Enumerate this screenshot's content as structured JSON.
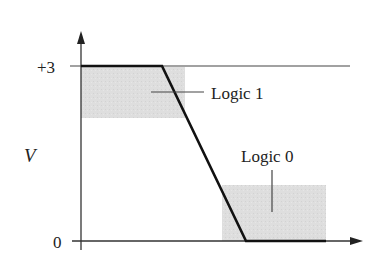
{
  "diagram": {
    "type": "logic-level voltage transition",
    "y_axis": {
      "label": "V",
      "ticks": [
        {
          "label": "+3",
          "value": 3
        },
        {
          "label": "0",
          "value": 0
        }
      ]
    },
    "regions": [
      {
        "label": "Logic 1",
        "description": "shaded band just below +3 V"
      },
      {
        "label": "Logic 0",
        "description": "shaded band just above 0 V"
      }
    ],
    "waveform": "high at +3 V, linear fall to 0 V, then low",
    "colors": {
      "line": "#111111",
      "axis": "#333333",
      "shade": "#dcdcdc",
      "text": "#222222"
    }
  }
}
